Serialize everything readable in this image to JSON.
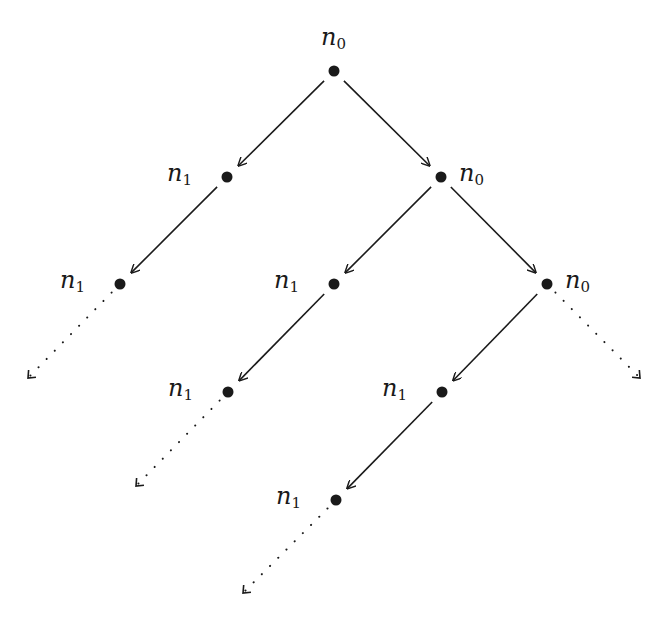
{
  "diagram": {
    "type": "binary-tree",
    "colors": {
      "ink": "#1a1a1a",
      "background": "#ffffff"
    },
    "nodes": [
      {
        "id": "root",
        "var": "n",
        "sub": "0",
        "x": 334,
        "y": 71,
        "label_side": "top"
      },
      {
        "id": "l1a",
        "var": "n",
        "sub": "1",
        "x": 227,
        "y": 177,
        "label_side": "left"
      },
      {
        "id": "l1b",
        "var": "n",
        "sub": "0",
        "x": 441,
        "y": 177,
        "label_side": "right"
      },
      {
        "id": "l2a",
        "var": "n",
        "sub": "1",
        "x": 120,
        "y": 284,
        "label_side": "left"
      },
      {
        "id": "l2b",
        "var": "n",
        "sub": "1",
        "x": 334,
        "y": 284,
        "label_side": "left"
      },
      {
        "id": "l2c",
        "var": "n",
        "sub": "0",
        "x": 547,
        "y": 284,
        "label_side": "right"
      },
      {
        "id": "l3a",
        "var": "n",
        "sub": "1",
        "x": 228,
        "y": 392,
        "label_side": "left"
      },
      {
        "id": "l3b",
        "var": "n",
        "sub": "1",
        "x": 442,
        "y": 392,
        "label_side": "left"
      },
      {
        "id": "l4a",
        "var": "n",
        "sub": "1",
        "x": 336,
        "y": 500,
        "label_side": "left"
      }
    ],
    "edges": [
      {
        "from": "root",
        "to": "l1a",
        "style": "solid"
      },
      {
        "from": "root",
        "to": "l1b",
        "style": "solid"
      },
      {
        "from": "l1a",
        "to": "l2a",
        "style": "solid"
      },
      {
        "from": "l1b",
        "to": "l2b",
        "style": "solid"
      },
      {
        "from": "l1b",
        "to": "l2c",
        "style": "solid"
      },
      {
        "from": "l2b",
        "to": "l3a",
        "style": "solid"
      },
      {
        "from": "l2c",
        "to": "l3b",
        "style": "solid"
      },
      {
        "from": "l3b",
        "to": "l4a",
        "style": "solid"
      }
    ],
    "dotted_edges": [
      {
        "from": "l2a",
        "to_x": 28,
        "to_y": 378
      },
      {
        "from": "l2c",
        "to_x": 640,
        "to_y": 378
      },
      {
        "from": "l3a",
        "to_x": 136,
        "to_y": 486
      },
      {
        "from": "l4a",
        "to_x": 243,
        "to_y": 593
      }
    ]
  }
}
